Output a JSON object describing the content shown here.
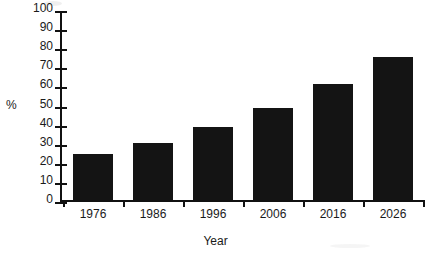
{
  "chart_data": {
    "type": "bar",
    "title": "",
    "categories": [
      "1976",
      "1986",
      "1996",
      "2006",
      "2016",
      "2026"
    ],
    "values": [
      24,
      30,
      38,
      48,
      61,
      75
    ],
    "xlabel": "Year",
    "ylabel": "%",
    "ylim": [
      0,
      100
    ],
    "y_ticks": [
      0,
      10,
      20,
      30,
      40,
      50,
      60,
      70,
      80,
      90,
      100
    ],
    "grid": false,
    "legend": "none",
    "bar_color": "#141414",
    "axis_color": "#111111",
    "background_color": "#ffffff"
  }
}
